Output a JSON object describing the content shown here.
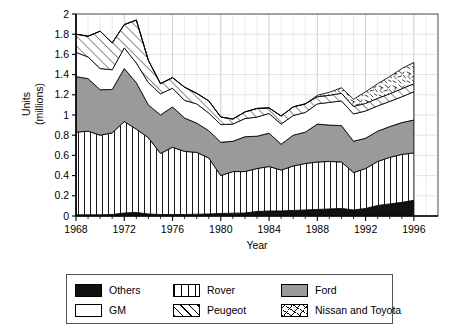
{
  "chart_data": {
    "type": "area",
    "stacked": true,
    "title": "",
    "xlabel": "Year",
    "ylabel": "Units\n(millions)",
    "ylabel_lines": [
      "Units",
      "(millions)"
    ],
    "xlim": [
      1968,
      1998
    ],
    "ylim": [
      0,
      2
    ],
    "y_ticks": [
      "0",
      "0.2",
      "0.4",
      "0.6",
      "0.8",
      "1",
      "1.2",
      "1.4",
      "1.6",
      "1.8",
      "2"
    ],
    "y_tick_values": [
      0,
      0.2,
      0.4,
      0.6,
      0.8,
      1,
      1.2,
      1.4,
      1.6,
      1.8,
      2
    ],
    "x_ticks": [
      "1968",
      "1972",
      "1976",
      "1980",
      "1984",
      "1988",
      "1992",
      "1996"
    ],
    "x_tick_values": [
      1968,
      1972,
      1976,
      1980,
      1984,
      1988,
      1992,
      1996
    ],
    "grid": true,
    "grid_minor_x": true,
    "legend_position": "bottom",
    "x": [
      1968,
      1969,
      1970,
      1971,
      1972,
      1973,
      1974,
      1975,
      1976,
      1977,
      1978,
      1979,
      1980,
      1981,
      1982,
      1983,
      1984,
      1985,
      1986,
      1987,
      1988,
      1989,
      1990,
      1991,
      1992,
      1993,
      1994,
      1995,
      1996
    ],
    "series": [
      {
        "name": "Others",
        "pattern": "solid-black",
        "color": "#111111",
        "values": [
          0.012,
          0.012,
          0.012,
          0.015,
          0.03,
          0.035,
          0.02,
          0.015,
          0.015,
          0.015,
          0.018,
          0.02,
          0.025,
          0.028,
          0.03,
          0.045,
          0.05,
          0.05,
          0.055,
          0.06,
          0.065,
          0.07,
          0.075,
          0.06,
          0.075,
          0.105,
          0.12,
          0.135,
          0.155
        ]
      },
      {
        "name": "Rover",
        "pattern": "vertical-lines",
        "color": "#ffffff",
        "values": [
          0.818,
          0.828,
          0.788,
          0.808,
          0.905,
          0.825,
          0.755,
          0.605,
          0.665,
          0.625,
          0.612,
          0.555,
          0.375,
          0.412,
          0.41,
          0.425,
          0.44,
          0.405,
          0.44,
          0.46,
          0.47,
          0.47,
          0.46,
          0.37,
          0.395,
          0.435,
          0.46,
          0.475,
          0.47
        ]
      },
      {
        "name": "Ford",
        "pattern": "solid-gray",
        "color": "#9a9a9a",
        "values": [
          0.55,
          0.52,
          0.45,
          0.43,
          0.525,
          0.46,
          0.325,
          0.38,
          0.4,
          0.33,
          0.29,
          0.27,
          0.33,
          0.3,
          0.345,
          0.32,
          0.33,
          0.255,
          0.305,
          0.31,
          0.375,
          0.36,
          0.36,
          0.31,
          0.3,
          0.3,
          0.305,
          0.315,
          0.325
        ]
      },
      {
        "name": "GM",
        "pattern": "solid-white",
        "color": "#ffffff",
        "values": [
          0.24,
          0.215,
          0.21,
          0.195,
          0.205,
          0.195,
          0.22,
          0.21,
          0.185,
          0.175,
          0.19,
          0.175,
          0.175,
          0.17,
          0.18,
          0.19,
          0.195,
          0.2,
          0.195,
          0.195,
          0.2,
          0.225,
          0.245,
          0.27,
          0.27,
          0.25,
          0.25,
          0.255,
          0.28
        ]
      },
      {
        "name": "Peugeot",
        "pattern": "diagonal-hatch",
        "color": "#ffffff",
        "values": [
          0.18,
          0.205,
          0.37,
          0.265,
          0.23,
          0.425,
          0.22,
          0.1,
          0.105,
          0.13,
          0.105,
          0.12,
          0.075,
          0.05,
          0.065,
          0.085,
          0.055,
          0.08,
          0.085,
          0.085,
          0.07,
          0.07,
          0.075,
          0.075,
          0.075,
          0.075,
          0.075,
          0.08,
          0.08
        ]
      },
      {
        "name": "Nissan and Toyota",
        "pattern": "scribble",
        "color": "#ffffff",
        "values": [
          0,
          0,
          0,
          0,
          0,
          0,
          0,
          0,
          0,
          0,
          0,
          0,
          0,
          0,
          0,
          0,
          0,
          0,
          0,
          0,
          0.015,
          0.03,
          0.055,
          0.07,
          0.115,
          0.145,
          0.17,
          0.2,
          0.21
        ]
      }
    ],
    "totals": [
      1.8,
      1.78,
      1.83,
      1.72,
      1.9,
      1.94,
      1.54,
      1.31,
      1.37,
      1.275,
      1.215,
      1.14,
      0.98,
      0.96,
      1.03,
      1.065,
      1.07,
      0.99,
      1.08,
      1.11,
      1.195,
      1.225,
      1.27,
      1.155,
      1.23,
      1.31,
      1.38,
      1.46,
      1.52
    ]
  },
  "legend": {
    "items": [
      {
        "label": "Others",
        "icon": "swatch-solid-black"
      },
      {
        "label": "Rover",
        "icon": "swatch-vertical-lines"
      },
      {
        "label": "Ford",
        "icon": "swatch-solid-gray"
      },
      {
        "label": "GM",
        "icon": "swatch-solid-white"
      },
      {
        "label": "Peugeot",
        "icon": "swatch-diagonal-hatch"
      },
      {
        "label": "Nissan and Toyota",
        "icon": "swatch-scribble"
      }
    ]
  },
  "colors": {
    "others": "#111111",
    "ford": "#9a9a9a",
    "gm": "#ffffff",
    "rover": "#ffffff",
    "peugeot": "#ffffff",
    "nissan_toyota": "#ffffff",
    "axis": "#000000",
    "grid": "#cccccc",
    "frame": "#555555"
  }
}
